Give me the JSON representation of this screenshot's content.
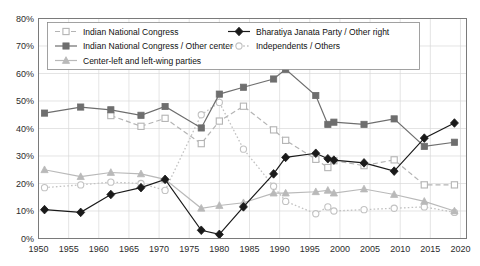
{
  "chart_data": {
    "type": "line",
    "title": "",
    "subtitle": "",
    "xlabel": "",
    "ylabel": "",
    "xlim": [
      1950,
      2021
    ],
    "ylim": [
      0,
      80
    ],
    "grid": true,
    "legend_position": "top-inside",
    "y_ticks": [
      "0%",
      "10%",
      "20%",
      "30%",
      "40%",
      "50%",
      "60%",
      "70%",
      "80%"
    ],
    "y_tick_values": [
      0,
      10,
      20,
      30,
      40,
      50,
      60,
      70,
      80
    ],
    "x_ticks": [
      "1950",
      "1955",
      "1960",
      "1965",
      "1970",
      "1975",
      "1980",
      "1985",
      "1990",
      "1995",
      "2000",
      "2005",
      "2010",
      "2015",
      "2020"
    ],
    "x_tick_values": [
      1950,
      1955,
      1960,
      1965,
      1970,
      1975,
      1980,
      1985,
      1990,
      1995,
      2000,
      2005,
      2010,
      2015,
      2020
    ],
    "series": [
      {
        "name": "Indian National Congress",
        "color": "#b4b4b4",
        "marker": "square-open",
        "dash": "dashed",
        "x": [
          1962,
          1967,
          1971,
          1977,
          1980,
          1984,
          1989,
          1991,
          1996,
          1998,
          1999,
          2004,
          2009,
          2014,
          2019
        ],
        "values": [
          44.7,
          40.8,
          43.7,
          34.5,
          42.7,
          48.1,
          39.5,
          35.7,
          28.8,
          25.8,
          28.3,
          26.5,
          28.6,
          19.5,
          19.5
        ]
      },
      {
        "name": "Indian National Congress / Other center",
        "color": "#6e6e6e",
        "marker": "square-filled",
        "dash": "solid",
        "x": [
          1951,
          1957,
          1962,
          1967,
          1971,
          1977,
          1980,
          1984,
          1989,
          1991,
          1996,
          1998,
          1999,
          2004,
          2009,
          2014,
          2019
        ],
        "values": [
          45.6,
          47.8,
          46.8,
          44.8,
          48.0,
          40.2,
          52.5,
          55.0,
          58.0,
          61.5,
          52.0,
          41.5,
          42.3,
          41.5,
          43.5,
          33.5,
          35.0
        ]
      },
      {
        "name": "Center-left and left-wing parties",
        "color": "#b9b9b9",
        "marker": "triangle-filled",
        "dash": "solid",
        "x": [
          1951,
          1957,
          1962,
          1967,
          1971,
          1977,
          1980,
          1984,
          1989,
          1991,
          1996,
          1998,
          1999,
          2004,
          2009,
          2014,
          2019
        ],
        "values": [
          25.0,
          22.5,
          24.0,
          23.5,
          21.5,
          11.0,
          12.0,
          13.0,
          16.5,
          16.5,
          17.0,
          17.5,
          16.5,
          18.0,
          16.0,
          13.5,
          10.0
        ]
      },
      {
        "name": "Bharatiya Janata Party / Other right",
        "color": "#1a1a1a",
        "marker": "diamond-filled",
        "dash": "solid",
        "x": [
          1951,
          1957,
          1962,
          1967,
          1971,
          1977,
          1980,
          1984,
          1989,
          1991,
          1996,
          1998,
          1999,
          2004,
          2009,
          2014,
          2019
        ],
        "values": [
          10.5,
          9.5,
          16.0,
          18.5,
          21.5,
          3.0,
          1.5,
          11.5,
          23.5,
          29.5,
          31.0,
          29.0,
          28.5,
          27.5,
          24.5,
          36.5,
          42.0
        ]
      },
      {
        "name": "Independents / Others",
        "color": "#c2c2c2",
        "marker": "circle-open",
        "dash": "dotted",
        "x": [
          1951,
          1957,
          1962,
          1967,
          1971,
          1977,
          1980,
          1984,
          1989,
          1991,
          1996,
          1998,
          1999,
          2004,
          2009,
          2014,
          2019
        ],
        "values": [
          18.5,
          19.5,
          20.5,
          20.0,
          17.5,
          45.0,
          49.5,
          32.5,
          19.0,
          13.5,
          9.0,
          11.5,
          10.0,
          10.5,
          11.0,
          11.5,
          9.5
        ]
      }
    ]
  },
  "legend": {
    "entries": [
      {
        "label": "Indian National Congress"
      },
      {
        "label": "Bharatiya Janata Party / Other right"
      },
      {
        "label": "Indian National Congress / Other center"
      },
      {
        "label": "Independents / Others"
      },
      {
        "label": "Center-left and left-wing parties"
      }
    ]
  }
}
